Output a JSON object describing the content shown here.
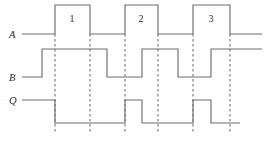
{
  "figure": {
    "kind": "digital-timing-diagram",
    "width": 268,
    "height": 141,
    "background_color": "#ffffff",
    "trace_color": "#6e6e6e",
    "marker_color": "#6b6b6b",
    "text_color": "#2a2a2a"
  },
  "signals": [
    {
      "id": "A",
      "label": "A",
      "label_x": 9,
      "label_y": 38,
      "low_y": 34,
      "high_y": 5,
      "start_x": 22,
      "end_x": 262,
      "transitions": [
        {
          "x": 55,
          "to": "high"
        },
        {
          "x": 90,
          "to": "low"
        },
        {
          "x": 125,
          "to": "high"
        },
        {
          "x": 158,
          "to": "low"
        },
        {
          "x": 193,
          "to": "high"
        },
        {
          "x": 230,
          "to": "low"
        }
      ],
      "initial_level": "low"
    },
    {
      "id": "B",
      "label": "B",
      "label_x": 9,
      "label_y": 81,
      "low_y": 77,
      "high_y": 49,
      "start_x": 22,
      "end_x": 262,
      "transitions": [
        {
          "x": 42,
          "to": "high"
        },
        {
          "x": 107,
          "to": "low"
        },
        {
          "x": 142,
          "to": "high"
        },
        {
          "x": 178,
          "to": "low"
        },
        {
          "x": 211,
          "to": "high"
        }
      ],
      "initial_level": "low"
    },
    {
      "id": "Q",
      "label": "Q",
      "label_x": 9,
      "label_y": 104,
      "low_y": 123,
      "high_y": 100,
      "start_x": 22,
      "end_x": 240,
      "transitions": [
        {
          "x": 55,
          "to": "low"
        },
        {
          "x": 125,
          "to": "high"
        },
        {
          "x": 142,
          "to": "low"
        },
        {
          "x": 193,
          "to": "high"
        },
        {
          "x": 211,
          "to": "low"
        }
      ],
      "initial_level": "high"
    }
  ],
  "pulse_labels": [
    {
      "text": "1",
      "x": 72,
      "y": 22
    },
    {
      "text": "2",
      "x": 141,
      "y": 22
    },
    {
      "text": "3",
      "x": 211,
      "y": 22
    }
  ],
  "edge_markers": [
    {
      "x": 55,
      "y_top": 34,
      "y_bottom": 133
    },
    {
      "x": 90,
      "y_top": 34,
      "y_bottom": 133
    },
    {
      "x": 125,
      "y_top": 34,
      "y_bottom": 133
    },
    {
      "x": 158,
      "y_top": 34,
      "y_bottom": 133
    },
    {
      "x": 193,
      "y_top": 34,
      "y_bottom": 133
    },
    {
      "x": 230,
      "y_top": 34,
      "y_bottom": 133
    }
  ]
}
